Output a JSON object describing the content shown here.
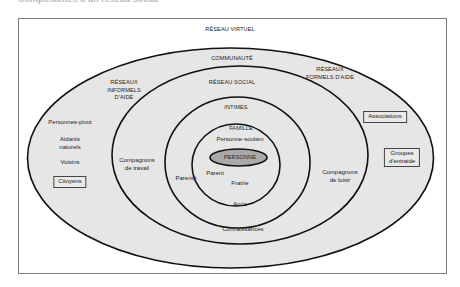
{
  "caption": "Composantes d'un réseau social",
  "layers": {
    "reseau_virtuel": "RÉSEAU VIRTUEL",
    "communaute": "COMMUNAUTÉ",
    "reseaux_informels": [
      "RÉSEAUX",
      "INFORMELS",
      "D'AIDE"
    ],
    "reseaux_formels": [
      "RÉSEAUX",
      "FORMELS D'AIDE"
    ],
    "reseau_social": "RÉSEAU SOCIAL",
    "intimes": "INTIMES",
    "famille": "FAMILLE",
    "personne": "PERSONNE"
  },
  "members": {
    "personne_soutien": "Personne-soutien",
    "parent": "Parent",
    "parente": "Parenté",
    "fratrie": "Fratrie",
    "amis": "Amis",
    "connaissances": "Connaissances",
    "compagnons_travail": [
      "Compagnons",
      "de travail"
    ],
    "compagnons_loisir": [
      "Compagnons",
      "de loisir"
    ],
    "personnes_pivot": "Personnes-pivot",
    "aidants_naturels": [
      "Aidants",
      "naturels"
    ],
    "voisins": "Voisins",
    "citoyens": "Citoyens",
    "associations": "Associations",
    "groupes_entraide": [
      "Groupes",
      "d'entraide"
    ]
  },
  "colors": {
    "ellipse_fill": "#e6e6e6",
    "personne_fill": "#a9a9a9",
    "stroke": "#111111",
    "frame": "#7a7a7a"
  }
}
